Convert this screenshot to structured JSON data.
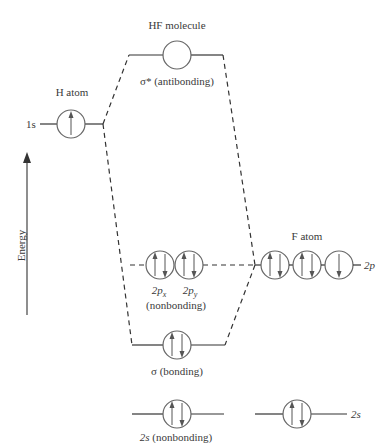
{
  "diagram": {
    "title_molecule": "HF molecule",
    "h_atom": {
      "title": "H atom",
      "orbital_label": "1s",
      "electrons": [
        "up"
      ]
    },
    "f_atom": {
      "title": "F atom",
      "p_label": "2p",
      "s_label": "2s",
      "p_orbitals": [
        [
          "up",
          "down"
        ],
        [
          "up",
          "down"
        ],
        [
          "down"
        ]
      ],
      "s_orbital": [
        "up",
        "down"
      ]
    },
    "mo": {
      "antibonding": {
        "label": "σ* (antibonding)",
        "electrons": []
      },
      "nonbonding_p": {
        "labels": [
          "2p",
          "2p"
        ],
        "subscripts": [
          "x",
          "y"
        ],
        "caption": "(nonbonding)",
        "orbitals": [
          [
            "up",
            "down"
          ],
          [
            "up",
            "down"
          ]
        ]
      },
      "bonding": {
        "label": "σ (bonding)",
        "electrons": [
          "up",
          "down"
        ]
      },
      "nonbonding_s": {
        "label_prefix": "2s",
        "label_suffix": " (nonbonding)",
        "electrons": [
          "up",
          "down"
        ]
      }
    },
    "axis": {
      "label": "Energy",
      "direction": "up"
    },
    "colors": {
      "line": "#333333",
      "circle": "#666666",
      "arrow": "#555555"
    }
  }
}
